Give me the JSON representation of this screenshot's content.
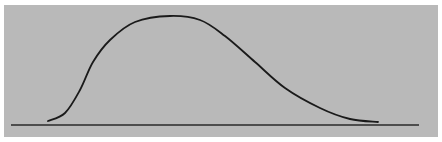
{
  "chart_data": {
    "type": "line",
    "title": "",
    "xlabel": "",
    "ylabel": "",
    "grid": false,
    "legend": null,
    "colors": {
      "background": "#b9b9b9",
      "curve": "#1a1a1a",
      "baseline": "#2a2a2a"
    },
    "baseline": {
      "x1": 11,
      "x2": 419,
      "y": 125
    },
    "points_px": [
      [
        48,
        121
      ],
      [
        65,
        113
      ],
      [
        80,
        90
      ],
      [
        93,
        62
      ],
      [
        110,
        40
      ],
      [
        135,
        22
      ],
      [
        170,
        16
      ],
      [
        200,
        20
      ],
      [
        225,
        36
      ],
      [
        255,
        62
      ],
      [
        285,
        88
      ],
      [
        320,
        108
      ],
      [
        350,
        119
      ],
      [
        378,
        122
      ]
    ],
    "x_relative": [
      0,
      0.05,
      0.1,
      0.14,
      0.19,
      0.26,
      0.37,
      0.46,
      0.53,
      0.62,
      0.71,
      0.82,
      0.91,
      1.0
    ],
    "y_relative": [
      0.03,
      0.11,
      0.33,
      0.59,
      0.8,
      0.96,
      1.0,
      0.97,
      0.82,
      0.58,
      0.34,
      0.16,
      0.06,
      0.03
    ]
  }
}
